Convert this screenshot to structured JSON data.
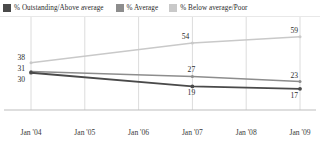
{
  "legend": {
    "items": [
      {
        "label": "% Outstanding/Above average",
        "color": "#4a4a4a",
        "swatch_name": "legend-swatch-outstanding"
      },
      {
        "label": "% Average",
        "color": "#8d8d8d",
        "swatch_name": "legend-swatch-average"
      },
      {
        "label": "% Below average/Poor",
        "color": "#c9c9c9",
        "swatch_name": "legend-swatch-below-average"
      }
    ]
  },
  "chart_data": {
    "type": "line",
    "title": "",
    "subtitle": "",
    "xlabel": "",
    "ylabel": "",
    "grid": true,
    "grid_axis": "x",
    "legend_position": "top",
    "categories": [
      "Jan '04",
      "Jan '05",
      "Jan '06",
      "Jan '07",
      "Jan '08",
      "Jan '09"
    ],
    "x": [
      "Jan '04",
      "Jan '07",
      "Jan '09"
    ],
    "ylim": [
      0,
      70
    ],
    "series": [
      {
        "name": "% Below average/Poor",
        "color": "#c9c9c9",
        "x": [
          "Jan '04",
          "Jan '07",
          "Jan '09"
        ],
        "values": [
          38,
          54,
          59
        ],
        "labels": [
          "38",
          "54",
          "59"
        ]
      },
      {
        "name": "% Average",
        "color": "#8d8d8d",
        "x": [
          "Jan '04",
          "Jan '07",
          "Jan '09"
        ],
        "values": [
          31,
          27,
          23
        ],
        "labels": [
          "31",
          "27",
          "23"
        ]
      },
      {
        "name": "% Outstanding/Above average",
        "color": "#4a4a4a",
        "x": [
          "Jan '04",
          "Jan '07",
          "Jan '09"
        ],
        "values": [
          30,
          19,
          17
        ],
        "labels": [
          "30",
          "19",
          "17"
        ]
      }
    ],
    "point_labels": {
      "left": [
        "38",
        "31",
        "30"
      ],
      "middle": [
        "54",
        "27",
        "19"
      ],
      "right": [
        "59",
        "23",
        "17"
      ]
    }
  },
  "axis": {
    "ticks": [
      "Jan '04",
      "Jan '05",
      "Jan '06",
      "Jan '07",
      "Jan '08",
      "Jan '09"
    ]
  },
  "colors": {
    "outstanding": "#4a4a4a",
    "average": "#8d8d8d",
    "below_average": "#c9c9c9",
    "gridline": "#dcdcdc",
    "axisline": "#bdbdbd",
    "text": "#2b2b2b"
  }
}
